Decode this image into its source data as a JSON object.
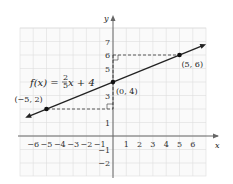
{
  "chart_data": {
    "type": "line",
    "title": "",
    "xlabel": "x",
    "ylabel": "y",
    "xlim": [
      -7,
      7
    ],
    "ylim": [
      -3,
      8
    ],
    "grid": true,
    "x_ticks": [
      -6,
      -5,
      -4,
      -3,
      -2,
      -1,
      1,
      2,
      3,
      4,
      5,
      6
    ],
    "y_ticks": [
      -2,
      -1,
      1,
      3,
      5,
      6,
      7
    ],
    "series": [
      {
        "name": "f(x) = 2/5 x + 4",
        "slope": 0.4,
        "intercept": 4,
        "x": [
          -6.6,
          7
        ],
        "y": [
          1.36,
          6.8
        ]
      }
    ],
    "points": [
      {
        "x": -5,
        "y": 2,
        "label": "(−5, 2)"
      },
      {
        "x": 0,
        "y": 4,
        "label": "(0, 4)"
      },
      {
        "x": 5,
        "y": 6,
        "label": "(5, 6)"
      }
    ],
    "annotations": {
      "equation": "f(x) = ",
      "fraction_num": "2",
      "fraction_den": "5",
      "equation_tail": "x + 4"
    },
    "colors": {
      "line": "#222222",
      "grid": "#dddddd",
      "axis": "#555555"
    }
  }
}
